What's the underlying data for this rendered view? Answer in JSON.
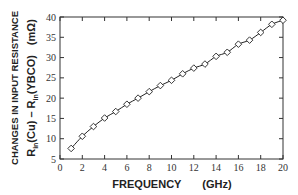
{
  "chart_data": {
    "type": "line",
    "title": "",
    "xlabel": "FREQUENCY    (GHz)",
    "xlabel_main": "FREQUENCY",
    "xlabel_unit": "(GHz)",
    "ylabel_line1": "CHANGES IN INPUT RESISTANCE",
    "ylabel_line2": "R_in(Cu) – R_in(YBCO)   (mΩ)",
    "ylabel_parts": {
      "r1": "R",
      "sub1": "in",
      "cu": "(Cu) – R",
      "sub2": "in",
      "ybco": "(YBCO)",
      "unit": "(mΩ)"
    },
    "xlim": [
      0,
      20
    ],
    "ylim": [
      5,
      40
    ],
    "xticks": [
      0,
      2,
      4,
      6,
      8,
      10,
      12,
      14,
      16,
      18,
      20
    ],
    "yticks": [
      5,
      10,
      15,
      20,
      25,
      30,
      35,
      40
    ],
    "grid": false,
    "legend": null,
    "series": [
      {
        "name": "measured",
        "marker": "diamond-open",
        "line": "solid",
        "x": [
          1,
          2,
          3,
          4,
          5,
          6,
          7,
          8,
          9,
          10,
          11,
          12,
          13,
          14,
          15,
          16,
          17,
          18,
          19,
          20
        ],
        "values": [
          7.6,
          10.6,
          13.0,
          15.1,
          16.7,
          18.5,
          20.0,
          21.6,
          23.1,
          24.4,
          26.0,
          27.4,
          28.4,
          30.3,
          31.3,
          33.3,
          34.3,
          36.2,
          38.2,
          39.2
        ]
      }
    ]
  },
  "colors": {
    "axis": "#333333",
    "line": "#222222",
    "marker_stroke": "#222222",
    "marker_fill": "#ffffff"
  }
}
